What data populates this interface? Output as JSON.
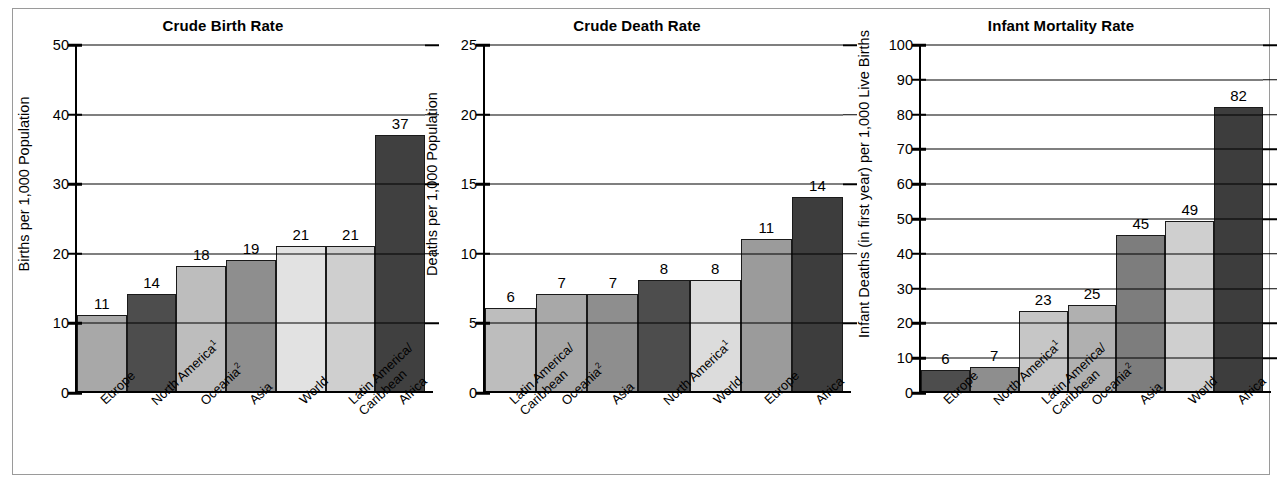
{
  "figure": {
    "background": "#ffffff",
    "border_color": "#9a9a9a"
  },
  "charts": [
    {
      "title": "Crude Birth Rate",
      "ylabel": "Births per 1,000 Population",
      "yticks": [
        "0",
        "10",
        "20",
        "30",
        "40",
        "50"
      ],
      "ymax": 50,
      "categories": [
        {
          "line1": "Europe",
          "line2": "",
          "sup": ""
        },
        {
          "line1": "North America",
          "line2": "",
          "sup": "1"
        },
        {
          "line1": "Oceania",
          "line2": "",
          "sup": "2"
        },
        {
          "line1": "Asia",
          "line2": "",
          "sup": ""
        },
        {
          "line1": "World",
          "line2": "",
          "sup": ""
        },
        {
          "line1": "Latin America/",
          "line2": "Caribbean",
          "sup": ""
        },
        {
          "line1": "Africa",
          "line2": "",
          "sup": ""
        }
      ],
      "values": [
        11,
        14,
        18,
        19,
        21,
        21,
        37
      ],
      "value_labels": [
        "11",
        "14",
        "18",
        "19",
        "21",
        "21",
        "37"
      ],
      "bar_colors": [
        "#a8a8a8",
        "#4d4d4d",
        "#bdbdbd",
        "#8e8e8e",
        "#e2e2e2",
        "#cfcfcf",
        "#404040"
      ]
    },
    {
      "title": "Crude Death Rate",
      "ylabel": "Deaths per 1,000 Population",
      "yticks": [
        "0",
        "5",
        "10",
        "15",
        "20",
        "25"
      ],
      "ymax": 25,
      "categories": [
        {
          "line1": "Latin America/",
          "line2": "Caribbean",
          "sup": ""
        },
        {
          "line1": "Oceania",
          "line2": "",
          "sup": "2"
        },
        {
          "line1": "Asia",
          "line2": "",
          "sup": ""
        },
        {
          "line1": "North America",
          "line2": "",
          "sup": "1"
        },
        {
          "line1": "World",
          "line2": "",
          "sup": ""
        },
        {
          "line1": "Europe",
          "line2": "",
          "sup": ""
        },
        {
          "line1": "Africa",
          "line2": "",
          "sup": ""
        }
      ],
      "values": [
        6,
        7,
        7,
        8,
        8,
        11,
        14
      ],
      "value_labels": [
        "6",
        "7",
        "7",
        "8",
        "8",
        "11",
        "14"
      ],
      "bar_colors": [
        "#bdbdbd",
        "#a8a8a8",
        "#8e8e8e",
        "#4d4d4d",
        "#dcdcdc",
        "#9b9b9b",
        "#3d3d3d"
      ]
    },
    {
      "title": "Infant Mortality Rate",
      "ylabel": "Infant Deaths (in first year) per 1,000 Live Births",
      "yticks": [
        "0",
        "10",
        "20",
        "30",
        "40",
        "50",
        "60",
        "70",
        "80",
        "90",
        "100"
      ],
      "ymax": 100,
      "categories": [
        {
          "line1": "Europe",
          "line2": "",
          "sup": ""
        },
        {
          "line1": "North America",
          "line2": "",
          "sup": "1"
        },
        {
          "line1": "Latin America/",
          "line2": "Caribbean",
          "sup": ""
        },
        {
          "line1": "Oceania",
          "line2": "",
          "sup": "2"
        },
        {
          "line1": "Asia",
          "line2": "",
          "sup": ""
        },
        {
          "line1": "World",
          "line2": "",
          "sup": ""
        },
        {
          "line1": "Africa",
          "line2": "",
          "sup": ""
        }
      ],
      "values": [
        6,
        7,
        23,
        25,
        45,
        49,
        82
      ],
      "value_labels": [
        "6",
        "7",
        "23",
        "25",
        "45",
        "49",
        "82"
      ],
      "bar_colors": [
        "#4d4d4d",
        "#8e8e8e",
        "#c6c6c6",
        "#b0b0b0",
        "#7d7d7d",
        "#cfcfcf",
        "#3d3d3d"
      ]
    }
  ],
  "chart_data": [
    {
      "type": "bar",
      "title": "Crude Birth Rate",
      "xlabel": "",
      "ylabel": "Births per 1,000 Population",
      "ylim": [
        0,
        50
      ],
      "ytick_values": [
        0,
        10,
        20,
        30,
        40,
        50
      ],
      "grid": true,
      "legend": "none",
      "categories": [
        "Europe",
        "North America¹",
        "Oceania²",
        "Asia",
        "World",
        "Latin America/Caribbean",
        "Africa"
      ],
      "values": [
        11,
        14,
        18,
        19,
        21,
        21,
        37
      ],
      "data_labels": [
        "11",
        "14",
        "18",
        "19",
        "21",
        "21",
        "37"
      ]
    },
    {
      "type": "bar",
      "title": "Crude Death Rate",
      "xlabel": "",
      "ylabel": "Deaths per 1,000 Population",
      "ylim": [
        0,
        25
      ],
      "ytick_values": [
        0,
        5,
        10,
        15,
        20,
        25
      ],
      "grid": true,
      "legend": "none",
      "categories": [
        "Latin America/Caribbean",
        "Oceania²",
        "Asia",
        "North America¹",
        "World",
        "Europe",
        "Africa"
      ],
      "values": [
        6,
        7,
        7,
        8,
        8,
        11,
        14
      ],
      "data_labels": [
        "6",
        "7",
        "7",
        "8",
        "8",
        "11",
        "14"
      ]
    },
    {
      "type": "bar",
      "title": "Infant Mortality Rate",
      "xlabel": "",
      "ylabel": "Infant Deaths (in first year) per 1,000 Live Births",
      "ylim": [
        0,
        100
      ],
      "ytick_values": [
        0,
        10,
        20,
        30,
        40,
        50,
        60,
        70,
        80,
        90,
        100
      ],
      "grid": true,
      "legend": "none",
      "categories": [
        "Europe",
        "North America¹",
        "Latin America/Caribbean",
        "Oceania²",
        "Asia",
        "World",
        "Africa"
      ],
      "values": [
        6,
        7,
        23,
        25,
        45,
        49,
        82
      ],
      "data_labels": [
        "6",
        "7",
        "23",
        "25",
        "45",
        "49",
        "82"
      ]
    }
  ]
}
